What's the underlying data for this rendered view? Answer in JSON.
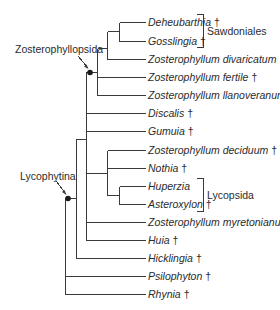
{
  "figure": {
    "type": "cladogram",
    "line_color": "#3a3a3a",
    "node_color": "#1a1a1a"
  },
  "taxa": [
    {
      "name": "Deheubarthia",
      "extinct": "†",
      "y": 22
    },
    {
      "name": "Gosslingia",
      "extinct": "†",
      "y": 41
    },
    {
      "name": "Zosterophyllum divaricatum",
      "extinct": "†",
      "y": 59
    },
    {
      "name": "Zosterophyllum fertile",
      "extinct": "†",
      "y": 77
    },
    {
      "name": "Zosterophyllum llanoveranum",
      "extinct": "†",
      "y": 95
    },
    {
      "name": "Discalis",
      "extinct": "†",
      "y": 113
    },
    {
      "name": "Gumuia",
      "extinct": "†",
      "y": 131
    },
    {
      "name": "Zosterophyllum deciduum",
      "extinct": "†",
      "y": 150
    },
    {
      "name": "Nothia",
      "extinct": "†",
      "y": 168
    },
    {
      "name": "Huperzia",
      "extinct": "",
      "y": 186
    },
    {
      "name": "Asteroxylon",
      "extinct": "†",
      "y": 204
    },
    {
      "name": "Zosterophyllum myretonianum",
      "extinct": "†",
      "y": 222
    },
    {
      "name": "Huia",
      "extinct": "†",
      "y": 240
    },
    {
      "name": "Hicklingia",
      "extinct": "†",
      "y": 258
    },
    {
      "name": "Psilophyton",
      "extinct": "†",
      "y": 276
    },
    {
      "name": "Rhynia",
      "extinct": "†",
      "y": 294
    }
  ],
  "groups": [
    {
      "label": "Sawdoniales",
      "y_top": 14,
      "y_bottom": 47,
      "label_y": 31
    },
    {
      "label": "Lycopsida",
      "y_top": 178,
      "y_bottom": 211,
      "label_y": 195
    }
  ],
  "clade_labels": [
    {
      "label": "Zosterophyllopsida",
      "node_x": 90,
      "node_y": 72
    },
    {
      "label": "Lycophytina",
      "node_x": 68,
      "node_y": 198
    }
  ]
}
